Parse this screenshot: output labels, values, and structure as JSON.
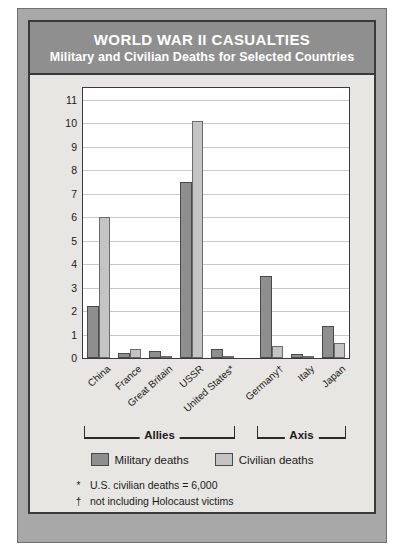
{
  "title": {
    "main": "WORLD WAR II CASUALTIES",
    "sub": "Military and Civilian Deaths for Selected Countries"
  },
  "legend": {
    "military_label": "Military deaths",
    "civilian_label": "Civilian deaths"
  },
  "groups": [
    {
      "label": "Allies"
    },
    {
      "label": "Axis"
    }
  ],
  "footnotes": [
    {
      "mark": "*",
      "text": "U.S. civilian deaths = 6,000"
    },
    {
      "mark": "†",
      "text": "not including Holocaust victims"
    }
  ],
  "colors": {
    "military": "#8e8e8e",
    "civilian": "#c4c4c4",
    "title_band": "#8f8f8f",
    "mat": "#a8a8a8",
    "card": "#e8e6e2",
    "frame": "#3a3a3a"
  },
  "chart_data": {
    "type": "bar",
    "title": "WORLD WAR II CASUALTIES",
    "subtitle": "Military and Civilian Deaths for Selected Countries",
    "xlabel": "",
    "ylabel": "Deaths (in millions)",
    "ylim": [
      0,
      11.5
    ],
    "yticks": [
      0,
      1,
      2,
      3,
      4,
      5,
      6,
      7,
      8,
      9,
      10,
      11
    ],
    "ytick_labels": [
      "0",
      "1",
      "2",
      "3",
      "4",
      "5",
      "6",
      "7",
      "8",
      "9",
      "10",
      "11"
    ],
    "grid": true,
    "legend_position": "below",
    "categories": [
      "China",
      "France",
      "Great Britain",
      "USSR",
      "United States*",
      "Germany†",
      "Italy",
      "Japan"
    ],
    "group_spans": [
      {
        "name": "Allies",
        "from": 0,
        "to": 4
      },
      {
        "name": "Axis",
        "from": 5,
        "to": 7
      }
    ],
    "series": [
      {
        "name": "Military deaths",
        "color": "#8e8e8e",
        "values": [
          2.2,
          0.2,
          0.3,
          7.5,
          0.4,
          3.5,
          0.15,
          1.35
        ]
      },
      {
        "name": "Civilian deaths",
        "color": "#c4c4c4",
        "values": [
          6.0,
          0.4,
          0.06,
          10.1,
          0.006,
          0.5,
          0.1,
          0.65
        ]
      }
    ],
    "annotations": [
      "* U.S. civilian deaths = 6,000",
      "† not including Holocaust victims"
    ]
  }
}
